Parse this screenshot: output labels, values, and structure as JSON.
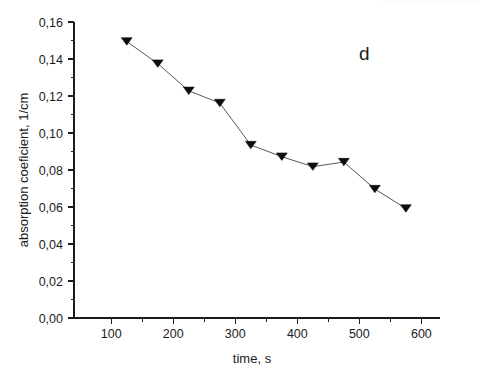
{
  "figure": {
    "background_color": "#ffffff",
    "panel_label": "d",
    "marker_color": "#0d0d0d",
    "line_color": "#555a5e",
    "axis_color": "#1c1c1c"
  },
  "chart_data": {
    "type": "line",
    "title": "",
    "subtitle": "",
    "xlabel": "time, s",
    "ylabel": "absorption coeficient, 1/cm",
    "xlim": [
      40,
      630
    ],
    "ylim": [
      0.0,
      0.16
    ],
    "grid": false,
    "legend": null,
    "legend_position": "none",
    "marker": "triangle-down",
    "annotations": [
      {
        "text": "d",
        "x": 508,
        "y": 0.1395
      }
    ],
    "x_ticks": [
      100,
      200,
      300,
      400,
      500,
      600
    ],
    "x_tick_labels": [
      "100",
      "200",
      "300",
      "400",
      "500",
      "600"
    ],
    "x_minor_ticks": [
      150,
      250,
      350,
      450,
      550
    ],
    "y_ticks": [
      0.0,
      0.02,
      0.04,
      0.06,
      0.08,
      0.1,
      0.12,
      0.14,
      0.16
    ],
    "y_tick_labels": [
      "0,00",
      "0,02",
      "0,04",
      "0,06",
      "0,08",
      "0,10",
      "0,12",
      "0,14",
      "0,16"
    ],
    "y_minor_ticks": [
      0.01,
      0.03,
      0.05,
      0.07,
      0.09,
      0.11,
      0.13,
      0.15
    ],
    "x": [
      125,
      175,
      225,
      275,
      325,
      375,
      425,
      475,
      525,
      575
    ],
    "values": [
      0.1495,
      0.1375,
      0.1228,
      0.1162,
      0.0935,
      0.0872,
      0.0818,
      0.0843,
      0.0697,
      0.0592
    ],
    "series": [
      {
        "name": "absorption coefficient",
        "points": [
          {
            "x": 125,
            "y": 0.1495
          },
          {
            "x": 175,
            "y": 0.1375
          },
          {
            "x": 225,
            "y": 0.1228
          },
          {
            "x": 275,
            "y": 0.1162
          },
          {
            "x": 325,
            "y": 0.0935
          },
          {
            "x": 375,
            "y": 0.0872
          },
          {
            "x": 425,
            "y": 0.0818
          },
          {
            "x": 475,
            "y": 0.0843
          },
          {
            "x": 525,
            "y": 0.0697
          },
          {
            "x": 575,
            "y": 0.0592
          }
        ]
      }
    ]
  }
}
